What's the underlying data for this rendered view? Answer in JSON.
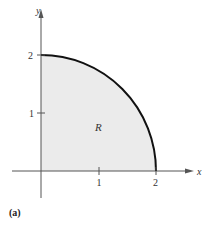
{
  "figure": {
    "caption": "(a)",
    "region_label": "R",
    "x_axis_label": "x",
    "y_axis_label": "y",
    "x_ticks": [
      "1",
      "2"
    ],
    "y_ticks": [
      "1",
      "2"
    ],
    "colors": {
      "region_fill": "#ebebeb",
      "curve": "#111111",
      "axes": "#555555"
    }
  }
}
